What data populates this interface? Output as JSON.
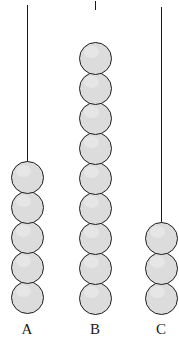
{
  "figure": {
    "background_color": "#ffffff",
    "width": 179,
    "height": 339,
    "bead": {
      "fill_color": "#dcdcdc",
      "outline_color": "#1c1c1c",
      "diameter": 33,
      "pitch": 30,
      "outline_width": 1.6
    },
    "string": {
      "color": "#1a1a1a",
      "width": 1
    }
  },
  "chart_data": {
    "type": "bar",
    "xlabel": "",
    "ylabel": "Number of beads",
    "categories": [
      "A",
      "B",
      "C"
    ],
    "values": [
      5,
      9,
      3
    ],
    "ylim": [
      0,
      9
    ],
    "grid": false,
    "legend": false,
    "annotations": [
      "Each column is a vertical string hanging from the top of the frame",
      "Beads are identical light-grey circles stacked and touching at the bottom of each string",
      "Column A: 5 beads, Column B: 9 beads, Column C: 3 beads"
    ]
  },
  "columns": [
    {
      "label": "A",
      "bead_count": 5,
      "center_x": 27,
      "string_top": 5,
      "string_bottom": 170,
      "stack_bottom": 314,
      "label_x": 27,
      "label_y": 322
    },
    {
      "label": "B",
      "bead_count": 9,
      "center_x": 95,
      "string_top": 1,
      "string_bottom": 10,
      "stack_bottom": 315,
      "label_x": 95,
      "label_y": 322
    },
    {
      "label": "C",
      "bead_count": 3,
      "center_x": 161,
      "string_top": 7,
      "string_bottom": 228,
      "stack_bottom": 315,
      "label_x": 161,
      "label_y": 322
    }
  ]
}
